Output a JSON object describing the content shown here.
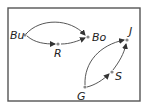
{
  "diagram": {
    "type": "directed-graph",
    "frame": {
      "x": 8,
      "y": 8,
      "width": 132,
      "height": 93
    },
    "nodes": [
      {
        "id": "Bu",
        "label": "Bu",
        "x": 25,
        "y": 35,
        "label_x": 10,
        "label_y": 39
      },
      {
        "id": "R",
        "label": "R",
        "x": 58,
        "y": 44,
        "label_x": 54,
        "label_y": 57
      },
      {
        "id": "Bo",
        "label": "Bo",
        "x": 88,
        "y": 37,
        "label_x": 92,
        "label_y": 41
      },
      {
        "id": "J",
        "label": "J",
        "x": 127,
        "y": 40,
        "label_x": 129,
        "label_y": 35
      },
      {
        "id": "S",
        "label": "S",
        "x": 112,
        "y": 72,
        "label_x": 115,
        "label_y": 80
      },
      {
        "id": "G",
        "label": "G",
        "x": 85,
        "y": 87,
        "label_x": 77,
        "label_y": 100
      }
    ],
    "edges": [
      {
        "from": "Bu",
        "to": "Bo",
        "curve": "arc-up"
      },
      {
        "from": "Bu",
        "to": "R",
        "curve": "slight"
      },
      {
        "from": "R",
        "to": "Bo",
        "curve": "slight"
      },
      {
        "from": "G",
        "to": "J",
        "curve": "arc-left"
      },
      {
        "from": "G",
        "to": "S",
        "curve": "slight"
      },
      {
        "from": "S",
        "to": "J",
        "curve": "slight"
      }
    ]
  },
  "labels": {
    "Bu": "Bu",
    "R": "R",
    "Bo": "Bo",
    "J": "J",
    "S": "S",
    "G": "G"
  }
}
